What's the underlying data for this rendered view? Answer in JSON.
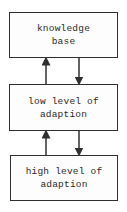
{
  "diagram": {
    "type": "block-flow",
    "direction": "vertical",
    "nodes": [
      {
        "id": "kb",
        "lines": [
          "knowledge",
          "base"
        ]
      },
      {
        "id": "low",
        "lines": [
          "low level of",
          "adaption"
        ]
      },
      {
        "id": "high",
        "lines": [
          "high level of",
          "adaption"
        ]
      }
    ],
    "edges": [
      {
        "from": "kb",
        "to": "low",
        "direction": "down"
      },
      {
        "from": "low",
        "to": "kb",
        "direction": "up"
      },
      {
        "from": "low",
        "to": "high",
        "direction": "down"
      },
      {
        "from": "high",
        "to": "low",
        "direction": "up"
      }
    ],
    "colors": {
      "line": "#2f2f2f",
      "text": "#2a2a2a",
      "background": "#ffffff"
    }
  }
}
